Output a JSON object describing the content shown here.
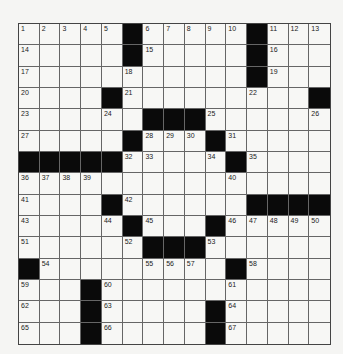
{
  "puzzle": {
    "rows": 15,
    "cols": 15,
    "grid": [
      [
        "1",
        "2",
        "3",
        "4",
        "5",
        "#",
        "6",
        "7",
        "8",
        "9",
        "10",
        "#",
        "11",
        "12",
        "13"
      ],
      [
        "14",
        "",
        "",
        "",
        "",
        "#",
        "15",
        "",
        "",
        "",
        "",
        "#",
        "16",
        "",
        ""
      ],
      [
        "17",
        "",
        "",
        "",
        "",
        "18",
        "",
        "",
        "",
        "",
        "",
        "#",
        "19",
        "",
        ""
      ],
      [
        "20",
        "",
        "",
        "",
        "#",
        "21",
        "",
        "",
        "",
        "",
        "",
        "22",
        "",
        "",
        "#"
      ],
      [
        "23",
        "",
        "",
        "",
        "24",
        "",
        "#",
        "#",
        "#",
        "25",
        "",
        "",
        "",
        "",
        "26"
      ],
      [
        "27",
        "",
        "",
        "",
        "",
        "#",
        "28",
        "29",
        "30",
        "#",
        "31",
        "",
        "",
        "",
        ""
      ],
      [
        "#",
        "#",
        "#",
        "#",
        "#",
        "32",
        "33",
        "",
        "",
        "34",
        "#",
        "35",
        "",
        "",
        ""
      ],
      [
        "36",
        "37",
        "38",
        "39",
        "",
        "",
        "",
        "",
        "",
        "",
        "40",
        "",
        "",
        "",
        ""
      ],
      [
        "41",
        "",
        "",
        "",
        "#",
        "42",
        "",
        "",
        "",
        "",
        "",
        "#",
        "#",
        "#",
        "#"
      ],
      [
        "43",
        "",
        "",
        "",
        "44",
        "#",
        "45",
        "",
        "",
        "#",
        "46",
        "47",
        "48",
        "49",
        "50"
      ],
      [
        "51",
        "",
        "",
        "",
        "",
        "52",
        "#",
        "#",
        "#",
        "53",
        "",
        "",
        "",
        "",
        ""
      ],
      [
        "#",
        "54",
        "",
        "",
        "",
        "",
        "55",
        "56",
        "57",
        "",
        "#",
        "58",
        "",
        "",
        ""
      ],
      [
        "59",
        "",
        "",
        "#",
        "60",
        "",
        "",
        "",
        "",
        "",
        "61",
        "",
        "",
        "",
        ""
      ],
      [
        "62",
        "",
        "",
        "#",
        "63",
        "",
        "",
        "",
        "",
        "#",
        "64",
        "",
        "",
        "",
        ""
      ],
      [
        "65",
        "",
        "",
        "#",
        "66",
        "",
        "",
        "",
        "",
        "#",
        "67",
        "",
        "",
        "",
        ""
      ]
    ]
  },
  "colors": {
    "black_square": "#0a0a0a",
    "white_square": "#f7f7f5",
    "grid_line": "#666666",
    "background": "#f5f5f3"
  }
}
